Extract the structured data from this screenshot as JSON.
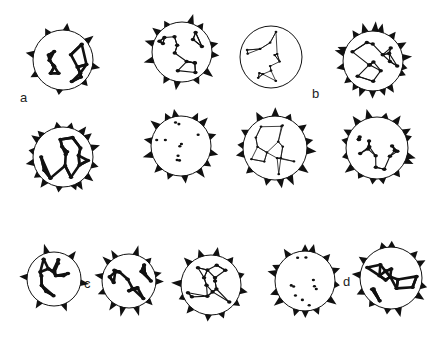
{
  "figure": {
    "panel_labels": [
      {
        "id": "a",
        "text": "a",
        "x": 22,
        "y": 98
      },
      {
        "id": "b",
        "text": "b",
        "x": 316,
        "y": 94
      },
      {
        "id": "c",
        "text": "c",
        "x": 86,
        "y": 283
      },
      {
        "id": "d",
        "text": "d",
        "x": 346,
        "y": 282
      }
    ],
    "grains": [
      {
        "id": "a1",
        "panel": "a",
        "cx": 63,
        "cy": 60,
        "r": 30,
        "style": "thick-reticulate",
        "spines": 8
      },
      {
        "id": "a2",
        "panel": "a",
        "cx": 182,
        "cy": 52,
        "r": 30,
        "style": "dotted-reticulate",
        "spines": 12
      },
      {
        "id": "a3",
        "panel": "a",
        "cx": 63,
        "cy": 157,
        "r": 30,
        "style": "thick-reticulate",
        "spines": 16
      },
      {
        "id": "a4",
        "panel": "a",
        "cx": 181,
        "cy": 146,
        "r": 30,
        "style": "sparse-dots",
        "spines": 14
      },
      {
        "id": "b1",
        "panel": "b",
        "cx": 271,
        "cy": 57,
        "r": 31,
        "style": "fine-reticulate",
        "spines": 0
      },
      {
        "id": "b2",
        "panel": "b",
        "cx": 373,
        "cy": 61,
        "r": 30,
        "style": "dotted-reticulate",
        "spines": 18
      },
      {
        "id": "b3",
        "panel": "b",
        "cx": 275,
        "cy": 148,
        "r": 32,
        "style": "fine-reticulate",
        "spines": 14
      },
      {
        "id": "b4",
        "panel": "b",
        "cx": 377,
        "cy": 148,
        "r": 31,
        "style": "dotted-reticulate",
        "spines": 16
      },
      {
        "id": "c1",
        "panel": "c",
        "cx": 54,
        "cy": 279,
        "r": 27,
        "style": "thick-reticulate",
        "spines": 6
      },
      {
        "id": "c2",
        "panel": "c",
        "cx": 129,
        "cy": 281,
        "r": 27,
        "style": "thick-reticulate",
        "spines": 12
      },
      {
        "id": "c3",
        "panel": "c",
        "cx": 211,
        "cy": 285,
        "r": 30,
        "style": "dotted-reticulate",
        "spines": 12
      },
      {
        "id": "d1",
        "panel": "d",
        "cx": 305,
        "cy": 281,
        "r": 30,
        "style": "sparse-dots",
        "spines": 14
      },
      {
        "id": "d2",
        "panel": "d",
        "cx": 391,
        "cy": 278,
        "r": 31,
        "style": "thick-reticulate",
        "spines": 12
      }
    ]
  }
}
